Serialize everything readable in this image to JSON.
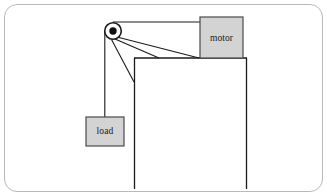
{
  "figure": {
    "type": "mechanical-diagram",
    "frame": {
      "border_color": "#b9b9b9",
      "corner_radius": 13,
      "background": "#ffffff"
    },
    "line_color": "#1a1a1a",
    "box_fill": "#d3d3d3",
    "box_stroke": "#4a4a4a",
    "components": {
      "motor": {
        "label": "motor",
        "x": 200,
        "y": 17,
        "width": 43,
        "height": 41
      },
      "load": {
        "label": "load",
        "x": 88,
        "y": 117,
        "width": 38,
        "height": 29
      },
      "pulley": {
        "label": "pulley",
        "cx": 113,
        "cy": 31,
        "outer_radius": 8.5,
        "hub_radius": 3.6
      },
      "support": {
        "label": "support-structure",
        "top_y": 58,
        "left_x": 134,
        "right_x": 247,
        "bottom_y": 189
      }
    },
    "cables": [
      {
        "name": "cable-pulley-to-motor",
        "x1": 113,
        "y1": 22,
        "x2": 200,
        "y2": 22
      },
      {
        "name": "cable-pulley-to-load",
        "x1": 104.5,
        "y1": 31,
        "x2": 104.5,
        "y2": 117
      },
      {
        "name": "brace-upper",
        "x1": 116,
        "y1": 38,
        "x2": 199,
        "y2": 58
      },
      {
        "name": "brace-middle",
        "x1": 114,
        "y1": 39,
        "x2": 160,
        "y2": 58
      },
      {
        "name": "brace-lower",
        "x1": 111,
        "y1": 39,
        "x2": 134,
        "y2": 82
      }
    ]
  }
}
